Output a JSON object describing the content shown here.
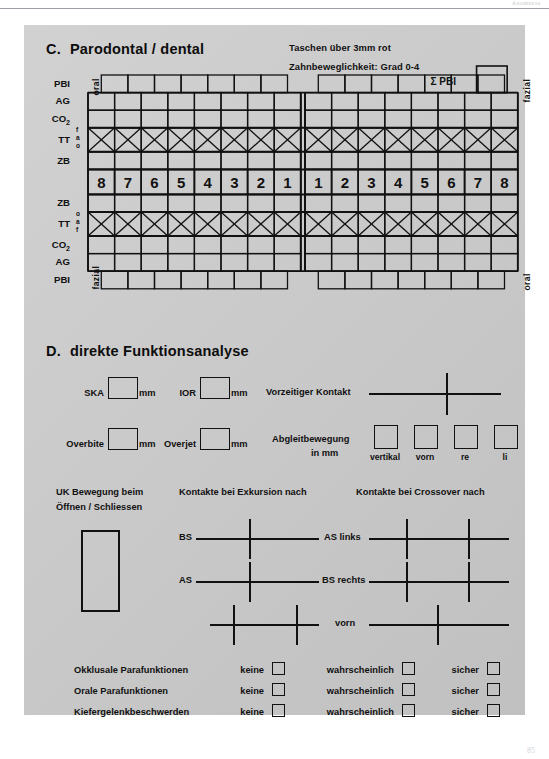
{
  "page": {
    "header_faint": "Anamnese",
    "page_number": "85",
    "bg_color": "#c9c9c9",
    "ink_color": "#111111"
  },
  "section_c": {
    "letter": "C.",
    "title": "Parodontal / dental",
    "notes": [
      "Taschen über 3mm rot",
      "Zahnbeweglichkeit: Grad 0-4"
    ],
    "sum_label": "Σ PBI",
    "side_labels": {
      "top_left": "oral",
      "top_right": "fazial",
      "bottom_left": "fazial",
      "bottom_right": "oral"
    },
    "upper_rows": [
      {
        "label": "PBI",
        "type": "offset"
      },
      {
        "label": "AG",
        "type": "plain"
      },
      {
        "label": "CO2",
        "type": "plain",
        "sub": "2"
      },
      {
        "label": "TT",
        "type": "cross",
        "sublabels": [
          "f",
          "a",
          "o"
        ]
      },
      {
        "label": "ZB",
        "type": "plain"
      }
    ],
    "lower_rows": [
      {
        "label": "ZB",
        "type": "plain"
      },
      {
        "label": "TT",
        "type": "cross",
        "sublabels": [
          "o",
          "a",
          "f"
        ]
      },
      {
        "label": "CO2",
        "type": "plain",
        "sub": "2"
      },
      {
        "label": "AG",
        "type": "plain"
      },
      {
        "label": "PBI",
        "type": "offset"
      }
    ],
    "teeth_right_quadrant": [
      "8",
      "7",
      "6",
      "5",
      "4",
      "3",
      "2",
      "1"
    ],
    "teeth_left_quadrant": [
      "1",
      "2",
      "3",
      "4",
      "5",
      "6",
      "7",
      "8"
    ]
  },
  "section_d": {
    "letter": "D.",
    "title": "direkte Funktionsanalyse",
    "measures": [
      {
        "label": "SKA",
        "unit": "mm"
      },
      {
        "label": "IOR",
        "unit": "mm"
      },
      {
        "label": "Overbite",
        "unit": "mm"
      },
      {
        "label": "Overjet",
        "unit": "mm"
      }
    ],
    "vorzeitiger_kontakt": "Vorzeitiger Kontakt",
    "abgleitbewegung": {
      "line1": "Abgleitbewegung",
      "line2": "in mm"
    },
    "abgleit_columns": [
      "vertikal",
      "vorn",
      "re",
      "li"
    ],
    "uk_bewegung": {
      "line1": "UK Bewegung beim",
      "line2": "Öffnen / Schliessen"
    },
    "exkursion_title": "Kontakte bei Exkursion nach",
    "crossover_title": "Kontakte bei Crossover nach",
    "excursion_rows": [
      {
        "left": "BS",
        "right": "AS links"
      },
      {
        "left": "AS",
        "right": "BS rechts"
      },
      {
        "left": "",
        "right": "vorn"
      }
    ],
    "parafunctions": {
      "options": [
        "keine",
        "wahrscheinlich",
        "sicher"
      ],
      "rows": [
        "Okklusale Parafunktionen",
        "Orale Parafunktionen",
        "Kiefergelenkbeschwerden"
      ]
    }
  }
}
